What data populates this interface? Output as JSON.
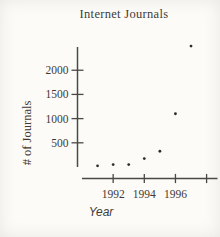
{
  "figure": {
    "background": "#fcfbf8"
  },
  "chart_data": {
    "type": "scatter",
    "title": "Internet Journals",
    "xlabel": "Year",
    "ylabel": "# of Journals",
    "x": [
      1991,
      1992,
      1993,
      1994,
      1995,
      1996,
      1997
    ],
    "values": [
      25,
      50,
      50,
      175,
      325,
      1100,
      2500
    ],
    "x_ticks": [
      {
        "year": 1992,
        "label": "1992"
      },
      {
        "year": 1994,
        "label": "1994"
      },
      {
        "year": 1996,
        "label": "1996"
      },
      {
        "year": 1998,
        "label": ""
      }
    ],
    "y_ticks": [
      {
        "value": 500,
        "label": "500"
      },
      {
        "value": 1000,
        "label": "1000"
      },
      {
        "value": 1500,
        "label": "1500"
      },
      {
        "value": 2000,
        "label": "2000"
      }
    ],
    "xlim": [
      1990,
      1998.7
    ],
    "ylim": [
      0,
      2480
    ],
    "grid": false,
    "legend": "none",
    "point_color": "#2e2c2a",
    "axis_color": "#4b4845",
    "text_color": "#3e3a36"
  }
}
